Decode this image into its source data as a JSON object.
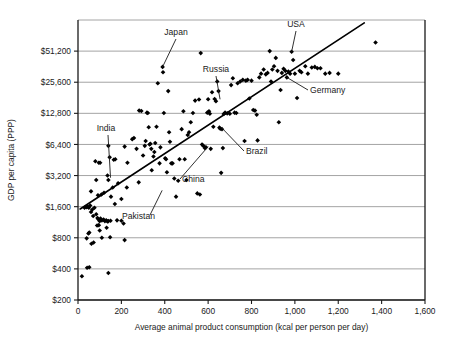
{
  "chart_data": {
    "type": "scatter",
    "title": "",
    "xlabel": "Average animal product consumption (kcal per person per day)",
    "ylabel": "GDP per capita (PPP)",
    "xlim": [
      0,
      1600
    ],
    "ylim": [
      200,
      102400
    ],
    "yscale": "log2",
    "grid": true,
    "legend": null,
    "xticks": [
      0,
      200,
      400,
      600,
      800,
      1000,
      1200,
      1400,
      1600
    ],
    "xticklabels": [
      "0",
      "200",
      "400",
      "600",
      "800",
      "1,000",
      "1,200",
      "1,400",
      "1,600"
    ],
    "yticks": [
      200,
      400,
      800,
      1600,
      3200,
      6400,
      12800,
      25600,
      51200
    ],
    "yticklabels": [
      "$200",
      "$400",
      "$800",
      "$1,600",
      "$3,200",
      "$6,400",
      "$12,800",
      "$25,600",
      "$51,200"
    ],
    "marker": "diamond",
    "marker_color": "#000000",
    "trendline": {
      "x0": 10,
      "y0": 1520,
      "x1": 1320,
      "y1": 96000
    },
    "annotations": [
      {
        "label": "Japan",
        "x": 390,
        "y": 36000
      },
      {
        "label": "Russia",
        "x": 655,
        "y": 17500
      },
      {
        "label": "USA",
        "x": 985,
        "y": 50500
      },
      {
        "label": "Germany",
        "x": 963,
        "y": 28500
      },
      {
        "label": "India",
        "x": 150,
        "y": 3050
      },
      {
        "label": "China",
        "x": 600,
        "y": 6100
      },
      {
        "label": "Brazil",
        "x": 660,
        "y": 9400
      },
      {
        "label": "Pakistan",
        "x": 388,
        "y": 2300
      }
    ],
    "points": [
      [
        18,
        340
      ],
      [
        42,
        410
      ],
      [
        52,
        415
      ],
      [
        140,
        365
      ],
      [
        40,
        790
      ],
      [
        48,
        880
      ],
      [
        52,
        900
      ],
      [
        62,
        700
      ],
      [
        72,
        720
      ],
      [
        88,
        1050
      ],
      [
        96,
        1060
      ],
      [
        100,
        940
      ],
      [
        110,
        800
      ],
      [
        132,
        1000
      ],
      [
        148,
        810
      ],
      [
        210,
        1100
      ],
      [
        215,
        760
      ],
      [
        30,
        1560
      ],
      [
        38,
        1580
      ],
      [
        44,
        1600
      ],
      [
        50,
        1560
      ],
      [
        56,
        1640
      ],
      [
        60,
        1420
      ],
      [
        66,
        1500
      ],
      [
        70,
        1300
      ],
      [
        76,
        1560
      ],
      [
        84,
        1350
      ],
      [
        90,
        1240
      ],
      [
        95,
        1200
      ],
      [
        100,
        1160
      ],
      [
        104,
        1230
      ],
      [
        110,
        1180
      ],
      [
        118,
        1200
      ],
      [
        124,
        1160
      ],
      [
        130,
        1180
      ],
      [
        136,
        1150
      ],
      [
        140,
        1160
      ],
      [
        150,
        1170
      ],
      [
        180,
        1180
      ],
      [
        200,
        1170
      ],
      [
        60,
        2250
      ],
      [
        84,
        2900
      ],
      [
        92,
        2060
      ],
      [
        108,
        2100
      ],
      [
        120,
        2180
      ],
      [
        136,
        3200
      ],
      [
        140,
        2900
      ],
      [
        152,
        2000
      ],
      [
        160,
        2450
      ],
      [
        170,
        1700
      ],
      [
        185,
        2700
      ],
      [
        200,
        1900
      ],
      [
        225,
        2450
      ],
      [
        280,
        2750
      ],
      [
        80,
        4400
      ],
      [
        96,
        4250
      ],
      [
        102,
        4250
      ],
      [
        140,
        6200
      ],
      [
        146,
        4800
      ],
      [
        165,
        4550
      ],
      [
        172,
        4600
      ],
      [
        215,
        6100
      ],
      [
        228,
        4250
      ],
      [
        250,
        7200
      ],
      [
        258,
        7400
      ],
      [
        270,
        5800
      ],
      [
        282,
        13600
      ],
      [
        292,
        13500
      ],
      [
        300,
        5000
      ],
      [
        308,
        6200
      ],
      [
        312,
        6900
      ],
      [
        318,
        13000
      ],
      [
        322,
        12900
      ],
      [
        326,
        9400
      ],
      [
        330,
        6400
      ],
      [
        334,
        6500
      ],
      [
        338,
        5800
      ],
      [
        340,
        3600
      ],
      [
        348,
        4900
      ],
      [
        352,
        5400
      ],
      [
        356,
        6600
      ],
      [
        362,
        9500
      ],
      [
        368,
        25000
      ],
      [
        376,
        4200
      ],
      [
        380,
        6000
      ],
      [
        390,
        36000
      ],
      [
        392,
        32000
      ],
      [
        396,
        12900
      ],
      [
        402,
        4700
      ],
      [
        406,
        4600
      ],
      [
        410,
        3450
      ],
      [
        416,
        21000
      ],
      [
        420,
        8400
      ],
      [
        424,
        6800
      ],
      [
        430,
        4200
      ],
      [
        436,
        4200
      ],
      [
        444,
        3000
      ],
      [
        452,
        2000
      ],
      [
        462,
        2850
      ],
      [
        468,
        4600
      ],
      [
        478,
        9000
      ],
      [
        486,
        13400
      ],
      [
        492,
        4600
      ],
      [
        500,
        2900
      ],
      [
        506,
        7900
      ],
      [
        512,
        8400
      ],
      [
        520,
        10500
      ],
      [
        530,
        12900
      ],
      [
        540,
        17000
      ],
      [
        550,
        2150
      ],
      [
        558,
        17400
      ],
      [
        562,
        2100
      ],
      [
        566,
        49000
      ],
      [
        572,
        6400
      ],
      [
        578,
        6200
      ],
      [
        585,
        5900
      ],
      [
        590,
        6000
      ],
      [
        596,
        13000
      ],
      [
        600,
        17500
      ],
      [
        604,
        13400
      ],
      [
        608,
        12700
      ],
      [
        612,
        5800
      ],
      [
        618,
        20500
      ],
      [
        624,
        9500
      ],
      [
        630,
        17600
      ],
      [
        636,
        16800
      ],
      [
        642,
        26000
      ],
      [
        648,
        21000
      ],
      [
        652,
        9300
      ],
      [
        656,
        9100
      ],
      [
        660,
        3400
      ],
      [
        664,
        9000
      ],
      [
        668,
        5900
      ],
      [
        672,
        12600
      ],
      [
        678,
        13000
      ],
      [
        688,
        12800
      ],
      [
        700,
        12700
      ],
      [
        706,
        24000
      ],
      [
        714,
        28000
      ],
      [
        722,
        13000
      ],
      [
        730,
        12900
      ],
      [
        736,
        25000
      ],
      [
        748,
        26000
      ],
      [
        760,
        27000
      ],
      [
        768,
        6900
      ],
      [
        774,
        26500
      ],
      [
        782,
        27000
      ],
      [
        790,
        17800
      ],
      [
        800,
        26500
      ],
      [
        808,
        13800
      ],
      [
        816,
        13600
      ],
      [
        824,
        12400
      ],
      [
        828,
        7000
      ],
      [
        836,
        28500
      ],
      [
        844,
        31000
      ],
      [
        856,
        34000
      ],
      [
        866,
        30500
      ],
      [
        874,
        31500
      ],
      [
        884,
        51200
      ],
      [
        890,
        26000
      ],
      [
        896,
        34000
      ],
      [
        904,
        36500
      ],
      [
        912,
        44000
      ],
      [
        920,
        33000
      ],
      [
        926,
        10500
      ],
      [
        934,
        21500
      ],
      [
        940,
        31500
      ],
      [
        948,
        34500
      ],
      [
        956,
        33000
      ],
      [
        963,
        28500
      ],
      [
        970,
        32500
      ],
      [
        978,
        31000
      ],
      [
        985,
        50500
      ],
      [
        992,
        42000
      ],
      [
        1000,
        31000
      ],
      [
        1010,
        18000
      ],
      [
        1022,
        33000
      ],
      [
        1030,
        32000
      ],
      [
        1048,
        36500
      ],
      [
        1060,
        31000
      ],
      [
        1078,
        35500
      ],
      [
        1092,
        36000
      ],
      [
        1104,
        35000
      ],
      [
        1118,
        35000
      ],
      [
        1140,
        31000
      ],
      [
        1160,
        31500
      ],
      [
        1200,
        31000
      ],
      [
        1372,
        62000
      ]
    ]
  }
}
